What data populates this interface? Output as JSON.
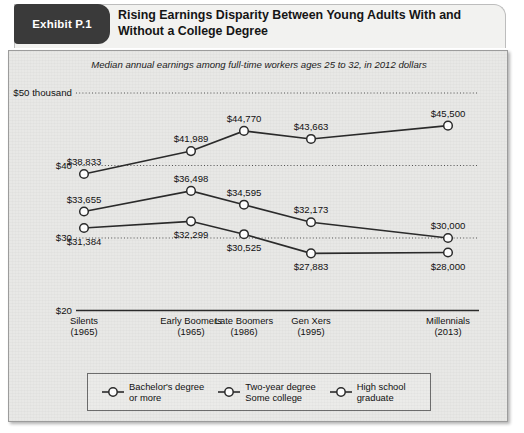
{
  "exhibit": {
    "badge_label": "Exhibit P.1",
    "title": "Rising Earnings Disparity Between Young Adults With and Without a College Degree"
  },
  "chart_data": {
    "type": "line",
    "title": "Rising Earnings Disparity Between Young Adults With and Without a College Degree",
    "subtitle": "Median annual earnings among full-time workers ages 25 to 32, in 2012 dollars",
    "xlabel": "",
    "ylabel": "",
    "ylim": [
      20000,
      50000
    ],
    "grid": true,
    "legend_position": "bottom",
    "categories": [
      "Silents",
      "Early Boomers",
      "Late Boomers",
      "Gen Xers",
      "Millennials"
    ],
    "category_years": [
      "(1965)",
      "(1965)",
      "(1986)",
      "(1995)",
      "(2013)"
    ],
    "ytick_labels": [
      "$50 thousand",
      "$40",
      "$30",
      "$20"
    ],
    "ytick_values": [
      50000,
      40000,
      30000,
      20000
    ],
    "series": [
      {
        "name": "Bachelor's degree or more",
        "legend_line1": "Bachelor's degree",
        "legend_line2": "or more",
        "values": [
          38833,
          41989,
          44770,
          43663,
          45500
        ],
        "labels": [
          "$38,833",
          "$41,989",
          "$44,770",
          "$43,663",
          "$45,500"
        ]
      },
      {
        "name": "Two-year degree Some college",
        "legend_line1": "Two-year degree",
        "legend_line2": "Some college",
        "values": [
          33655,
          36498,
          34595,
          32173,
          30000
        ],
        "labels": [
          "$33,655",
          "$36,498",
          "$34,595",
          "$32,173",
          "$30,000"
        ]
      },
      {
        "name": "High school graduate",
        "legend_line1": "High school",
        "legend_line2": "graduate",
        "values": [
          31384,
          32299,
          30525,
          27883,
          28000
        ],
        "labels": [
          "$31,384",
          "$32,299",
          "$30,525",
          "$27,883",
          "$28,000"
        ]
      }
    ],
    "colors": {
      "line": "#2b2b2b",
      "marker_fill": "#ffffff",
      "panel_bg": "#e8e8e6",
      "badge_bg": "#3a3a3a"
    }
  }
}
